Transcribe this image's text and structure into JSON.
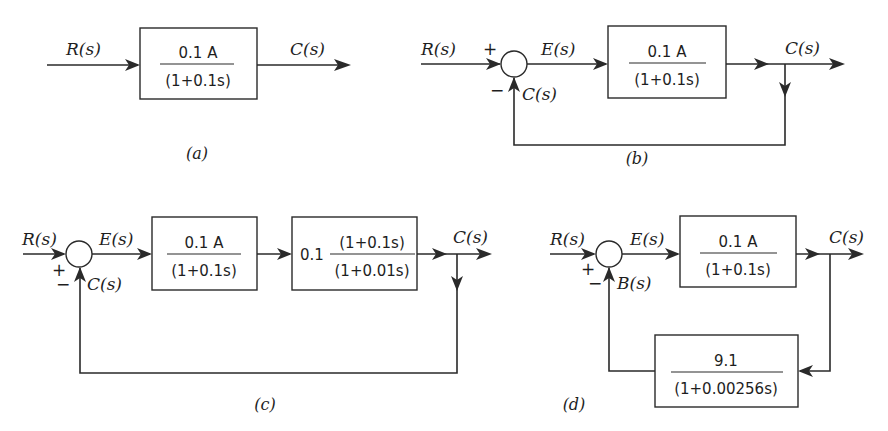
{
  "diagrams": {
    "a": {
      "caption": "(a)",
      "input": "R(s)",
      "output": "C(s)",
      "block": {
        "num": "0.1 A",
        "den": "(1+0.1s)"
      }
    },
    "b": {
      "caption": "(b)",
      "input": "R(s)",
      "error": "E(s)",
      "output": "C(s)",
      "feedback": "C(s)",
      "plus": "+",
      "minus": "−",
      "block": {
        "num": "0.1 A",
        "den": "(1+0.1s)"
      }
    },
    "c": {
      "caption": "(c)",
      "input": "R(s)",
      "error": "E(s)",
      "output": "C(s)",
      "feedback": "C(s)",
      "plus": "+",
      "minus": "−",
      "block1": {
        "num": "0.1 A",
        "den": "(1+0.1s)"
      },
      "block2": {
        "gain": "0.1",
        "num": "(1+0.1s)",
        "den": "(1+0.01s)"
      }
    },
    "d": {
      "caption": "(d)",
      "input": "R(s)",
      "error": "E(s)",
      "output": "C(s)",
      "feedback": "B(s)",
      "plus": "+",
      "minus": "−",
      "forward_block": {
        "num": "0.1 A",
        "den": "(1+0.1s)"
      },
      "feedback_block": {
        "num": "9.1",
        "den": "(1+0.00256s)"
      }
    }
  }
}
